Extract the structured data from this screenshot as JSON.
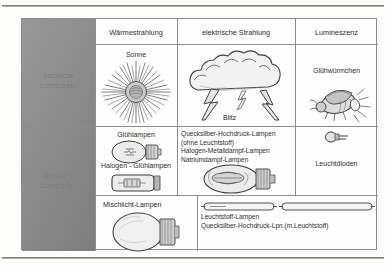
{
  "document": {
    "title": "Lichtquellen",
    "language": "de"
  },
  "table": {
    "corner_blank": "",
    "columns": [
      {
        "id": "waerme",
        "label": "Wärmestrahlung"
      },
      {
        "id": "elektrisch",
        "label": "elektrische Strahlung"
      },
      {
        "id": "lumineszenz",
        "label": "Lumineszenz"
      }
    ],
    "row_headers": [
      {
        "id": "natuerlich",
        "line1": "natürliche",
        "line2": "Lichtquellen"
      },
      {
        "id": "kuenstlich",
        "line1": "künstliche",
        "line2": "Lichtquellen"
      }
    ],
    "natural_row": {
      "waerme": {
        "label": "Sonne",
        "icon": "sun-icon"
      },
      "elektrisch": {
        "label": "Blitz",
        "icon": "lightning-cloud-icon"
      },
      "lumineszenz": {
        "label": "Glühwürmchen",
        "icon": "firefly-icon"
      }
    },
    "artificial_row": {
      "waerme": {
        "label_top": "Glühlampen",
        "label_bottom": "Halogen - Glühlampen",
        "icon_top": "incandescent-bulb-icon",
        "icon_bottom": "halogen-lamp-icon"
      },
      "elektrisch": {
        "lines": [
          "Quecksilber-Hochdruck-Lampen",
          "(ohne Leuchtstoff)",
          "Halogen-Metalldampf-Lampen",
          "Natriumdampf-Lampen"
        ],
        "icon": "metal-halide-lamp-icon"
      },
      "lumineszenz": {
        "label": "Leuchtdioden",
        "icon": "led-icon"
      }
    },
    "bottom_row": {
      "left": {
        "label": "Mischlicht-Lampen",
        "icon": "mixed-light-lamp-icon"
      },
      "right": {
        "lines": [
          "Leuchtstoff-Lampen",
          "Quecksilber-Hochdruck-Lpn.(m.Leuchtstoff)"
        ],
        "icons": [
          "fluorescent-tube-icon",
          "fluorescent-tube-icon"
        ]
      }
    }
  },
  "colors": {
    "sidebar": "#8c8c8c",
    "grid": "#8d8d8d",
    "page": "#fdfdfc",
    "text": "#2e2e2e"
  }
}
